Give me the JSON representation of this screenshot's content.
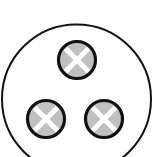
{
  "diagram": {
    "outer_circle": {
      "cx": 76.5,
      "cy": 99,
      "r": 74.5,
      "stroke": "#111111",
      "stroke_width": 2,
      "fill": "#ffffff"
    },
    "nodes": [
      {
        "id": "top",
        "cx": 77,
        "cy": 60,
        "r": 18.5,
        "fill": "#c0c0c0",
        "stroke": "#111111",
        "mark": "x"
      },
      {
        "id": "bottom-left",
        "cx": 46,
        "cy": 119,
        "r": 18.5,
        "fill": "#c0c0c0",
        "stroke": "#111111",
        "mark": "x"
      },
      {
        "id": "bottom-right",
        "cx": 104,
        "cy": 119,
        "r": 18.5,
        "fill": "#c0c0c0",
        "stroke": "#111111",
        "mark": "x"
      }
    ],
    "node_stroke_width": 3.2,
    "mark_color": "#ffffff",
    "mark_stroke_width": 5
  }
}
